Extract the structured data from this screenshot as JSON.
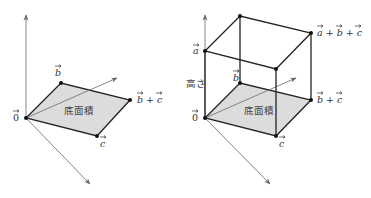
{
  "left": {
    "labels": {
      "origin": "0",
      "b": "b",
      "c": "c",
      "b_plus_c": "b + c",
      "area": "底面積"
    }
  },
  "right": {
    "labels": {
      "origin": "0",
      "a": "a",
      "b": "b",
      "c": "c",
      "b_plus_c": "b + c",
      "a_plus_b_plus_c": "a + b + c",
      "height": "高さ",
      "area": "底面積"
    }
  },
  "colors": {
    "face_fill": "#dcdcdc",
    "edge": "#222222",
    "axis": "#777777"
  }
}
